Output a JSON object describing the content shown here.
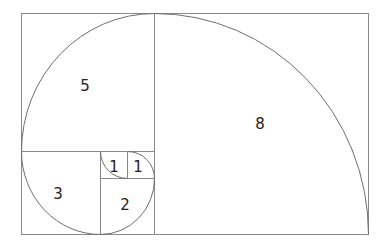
{
  "diagram": {
    "colors": {
      "line": "#8a8a8a",
      "spiral": "#6e6e6e",
      "text": "#222222"
    },
    "squares": [
      {
        "id": "sq-8",
        "label": "8"
      },
      {
        "id": "sq-5",
        "label": "5"
      },
      {
        "id": "sq-3",
        "label": "3"
      },
      {
        "id": "sq-2",
        "label": "2"
      },
      {
        "id": "sq-1a",
        "label": "1"
      },
      {
        "id": "sq-1b",
        "label": "1"
      }
    ]
  }
}
